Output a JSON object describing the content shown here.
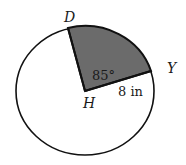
{
  "diagram": {
    "type": "circle-sector",
    "center_label": "H",
    "point_labels": {
      "D": "D",
      "Y": "Y",
      "H": "H"
    },
    "angle_label": "85°",
    "radius_label": "8 in",
    "colors": {
      "sector_fill": "#6b6b6b",
      "stroke": "#111111",
      "background": "#ffffff"
    }
  }
}
